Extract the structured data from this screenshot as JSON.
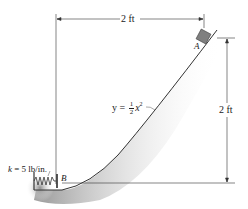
{
  "diagram": {
    "top_dimension": {
      "label": "2 ft"
    },
    "right_dimension": {
      "label": "2 ft"
    },
    "point_a": {
      "label": "A"
    },
    "point_b": {
      "label": "B"
    },
    "curve_equation": {
      "lhs": "y =",
      "frac_num": "1",
      "frac_den": "2",
      "var": "x",
      "exp": "2"
    },
    "spring": {
      "k_symbol": "k",
      "label": " = 5 lb/in."
    },
    "colors": {
      "line": "#333333",
      "shadow": "#9a9a9a",
      "block": "#7f7f7f"
    }
  }
}
